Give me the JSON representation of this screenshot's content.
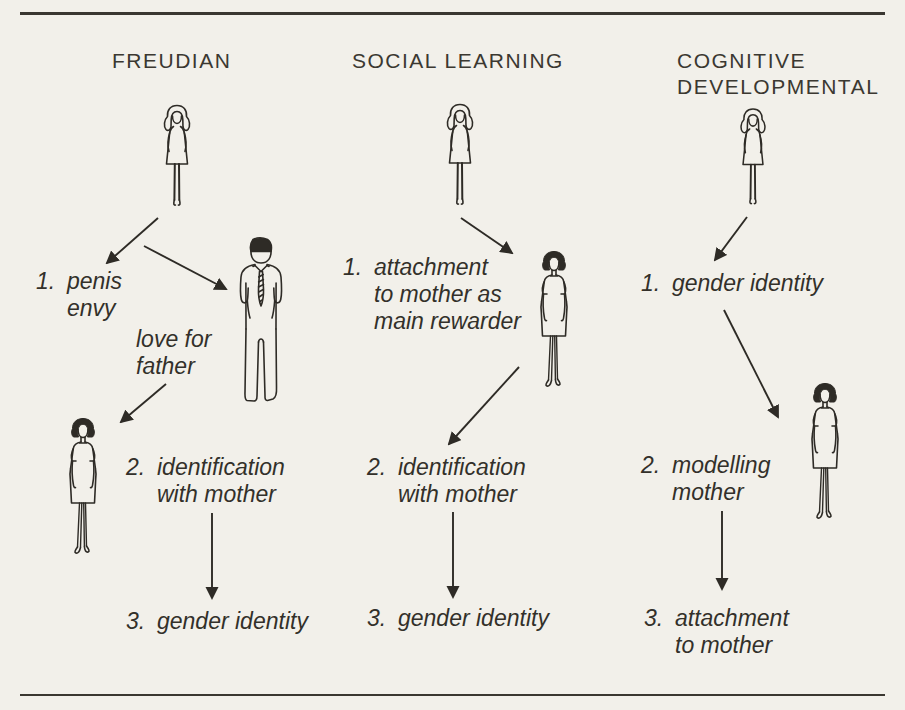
{
  "diagram": {
    "paper_color": "#f2f0ea",
    "ink_color": "#2e2b26"
  },
  "columns": [
    {
      "title": "FREUDIAN",
      "annotation": "love for\nfather",
      "steps": [
        {
          "num": "1.",
          "text": "penis\nenvy"
        },
        {
          "num": "2.",
          "text": "identification\nwith mother"
        },
        {
          "num": "3.",
          "text": "gender identity"
        }
      ]
    },
    {
      "title": "SOCIAL LEARNING",
      "steps": [
        {
          "num": "1.",
          "text": "attachment\nto mother as\nmain rewarder"
        },
        {
          "num": "2.",
          "text": "identification\nwith mother"
        },
        {
          "num": "3.",
          "text": "gender identity"
        }
      ]
    },
    {
      "title": "COGNITIVE\nDEVELOPMENTAL",
      "steps": [
        {
          "num": "1.",
          "text": "gender identity"
        },
        {
          "num": "2.",
          "text": "modelling\nmother"
        },
        {
          "num": "3.",
          "text": "attachment\nto mother"
        }
      ]
    }
  ],
  "figures": {
    "girl": "girl-child-figure",
    "father": "father-figure",
    "mother": "mother-figure"
  }
}
